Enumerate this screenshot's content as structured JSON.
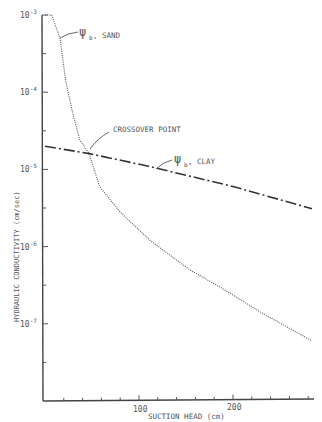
{
  "chart_data": {
    "type": "line",
    "title": "",
    "xlabel": "SUCTION HEAD (cm)",
    "ylabel": "HYDRAULIC CONDUCTIVITY (cm/sec)",
    "xlim": [
      0,
      290
    ],
    "ylim": [
      1e-08,
      0.001
    ],
    "yscale": "log",
    "grid": false,
    "x_ticks": [
      100,
      200
    ],
    "x_tick_labels": [
      "100",
      "200"
    ],
    "x_minor_tick_step": 20,
    "y_ticks": [
      0.001,
      0.0001,
      1e-05,
      1e-06,
      1e-07
    ],
    "y_tick_labels": [
      {
        "base": "10",
        "exp": "-3"
      },
      {
        "base": "10",
        "exp": "-4"
      },
      {
        "base": "10",
        "exp": "-5"
      },
      {
        "base": "10",
        "exp": "-6"
      },
      {
        "base": "10",
        "exp": "-7"
      }
    ],
    "series": [
      {
        "name": "ψ_b, SAND",
        "style": "dotted",
        "x": [
          0,
          7,
          16,
          22,
          30,
          37,
          47,
          58,
          80,
          112,
          154,
          186,
          230,
          284
        ],
        "y": [
          0.001,
          0.001,
          0.0005,
          0.00014,
          5e-05,
          2.4e-05,
          1.6e-05,
          6e-06,
          2.8e-06,
          1.2e-06,
          5e-07,
          3e-07,
          1.4e-07,
          6e-08
        ]
      },
      {
        "name": "ψ_b, CLAY",
        "style": "dash-dot",
        "x": [
          0,
          47,
          110,
          200,
          284
        ],
        "y": [
          2e-05,
          1.6e-05,
          1.1e-05,
          6e-06,
          3.1e-06
        ]
      }
    ],
    "annotations": [
      {
        "text": "CROSSOVER POINT",
        "x": 47,
        "y": 1.6e-05
      },
      {
        "text": "ψ_b, SAND",
        "psi": "ψ",
        "sub": "b",
        "suffix": ", SAND",
        "x": 20,
        "y": 0.0003
      },
      {
        "text": "ψ_b, CLAY",
        "psi": "ψ",
        "sub": "b",
        "suffix": ", CLAY",
        "x": 115,
        "y": 1.05e-05
      }
    ]
  },
  "labels": {
    "xlabel": "SUCTION HEAD (cm)",
    "ylabel": "HYDRAULIC CONDUCTIVITY (cm/sec)",
    "crossover": "CROSSOVER POINT",
    "sand_psi": "ψ",
    "sand_sub": "b",
    "sand_suffix": ", SAND",
    "clay_psi": "ψ",
    "clay_sub": "b",
    "clay_suffix": ", CLAY",
    "xtick_100": "100",
    "xtick_200": "200",
    "ytick_base": "10",
    "ytick_exp_3": "-3",
    "ytick_exp_4": "-4",
    "ytick_exp_5": "-5",
    "ytick_exp_6": "-6",
    "ytick_exp_7": "-7"
  }
}
